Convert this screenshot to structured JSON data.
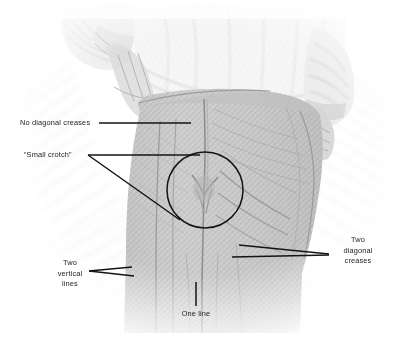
{
  "figure": {
    "kind": "annotated-illustration",
    "background_color": "#ffffff",
    "ink_color": "#1c1c1c",
    "sketch_color": "#9a9a9a"
  },
  "page_number": "",
  "annotations": [
    {
      "id": "no-diagonal-creases",
      "text": "No diagonal creases",
      "leader": "single-horizontal-line",
      "points_to": "seat-of-trousers"
    },
    {
      "id": "small-crotch",
      "text": "“Small crotch”",
      "leader": "wedge-to-circle",
      "points_to": "crotch-detail-circle"
    },
    {
      "id": "two-vertical-lines",
      "text_lines": [
        "Two",
        "vertical",
        "lines"
      ],
      "text": "Two vertical lines",
      "leader": "narrow-wedge",
      "points_to": "left-leg-vertical-lines"
    },
    {
      "id": "two-diagonal-creases",
      "text_lines": [
        "Two",
        "diagonal",
        "creases"
      ],
      "text": "Two diagonal creases",
      "leader": "converging-pair",
      "points_to": "right-thigh-creases"
    },
    {
      "id": "one-line",
      "text": "One line",
      "leader": "vertical-stem",
      "points_to": "center-inseam-line"
    }
  ],
  "detail_circle": {
    "center_x": 205,
    "center_y": 190,
    "radius": 38
  }
}
